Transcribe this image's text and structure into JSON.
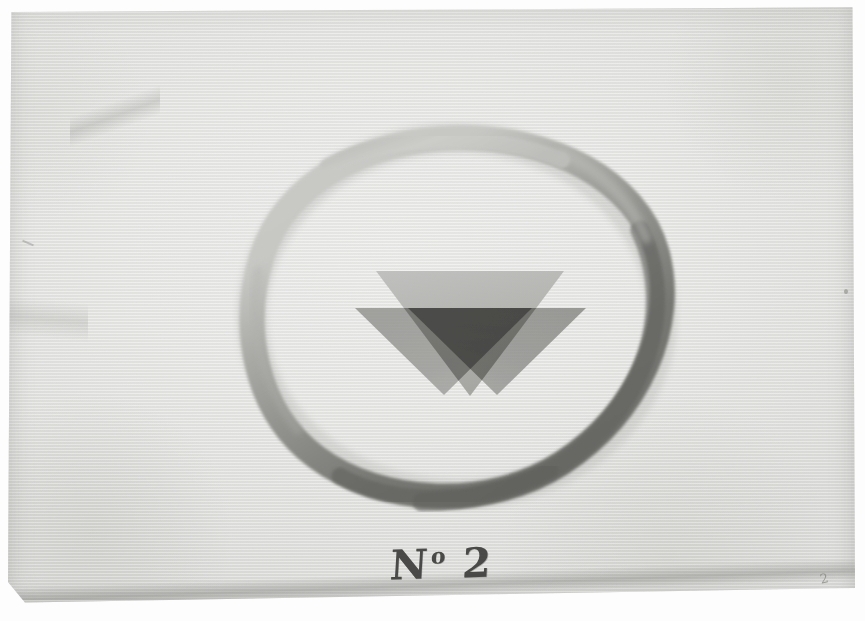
{
  "artwork": {
    "title": "Abstract composition with circle and three inverted triangles",
    "medium_appearance": "watercolor and gouache on laid paper, scanned",
    "caption": {
      "prefix": "N",
      "ordinal": "o",
      "number": "2",
      "full_text": "No 2"
    },
    "annotations": {
      "pencil_mark_upper": "2",
      "pencil_mark_lower_left": "hs",
      "pencil_mark_lower_right": "174"
    },
    "colors": {
      "paper": "#e8e8e6",
      "paper_edge": "#dcdcda",
      "background": "#ffffff",
      "ring_light": "#c3c3c0",
      "ring_mid": "#9a9a96",
      "ring_dark": "#6e6e6a",
      "triangle_upper": "#b4b4b2",
      "triangle_lower": "#8a8a87",
      "overlap_double": "#6f6f6c",
      "overlap_triple": "#5a5a57",
      "caption_ink": "#3a3a38",
      "pencil": "#8d8d88"
    },
    "shapes": {
      "ring": {
        "name": "brushed-circle",
        "center_x": 449,
        "center_y": 310,
        "radius_x": 205,
        "radius_y": 178,
        "stroke_width": 26
      },
      "triangles": [
        {
          "name": "upper-triangle",
          "orientation": "inverted",
          "tone": "light",
          "apex_x": 462,
          "apex_y": 390,
          "top_left_x": 368,
          "top_right_x": 556,
          "top_y": 265
        },
        {
          "name": "lower-left-triangle",
          "orientation": "inverted",
          "tone": "medium",
          "apex_x": 436,
          "apex_y": 389,
          "top_left_x": 347,
          "top_right_x": 524,
          "top_y": 302
        },
        {
          "name": "lower-right-triangle",
          "orientation": "inverted",
          "tone": "medium",
          "apex_x": 489,
          "apex_y": 389,
          "top_left_x": 400,
          "top_right_x": 578,
          "top_y": 302
        }
      ]
    }
  }
}
